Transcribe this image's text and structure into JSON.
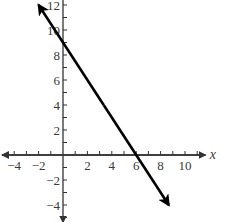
{
  "chart_data": {
    "type": "line",
    "title": "",
    "xlabel": "x",
    "ylabel": "",
    "xlim": [
      -4.8,
      11.2
    ],
    "ylim": [
      -5,
      12.5
    ],
    "x_ticks": [
      -4,
      -2,
      2,
      4,
      6,
      8,
      10
    ],
    "y_ticks": [
      -4,
      -2,
      2,
      4,
      6,
      8,
      10,
      12
    ],
    "x_minor_step": 1,
    "y_minor_step": 1,
    "grid": false,
    "series": [
      {
        "name": "line",
        "equation": "y = -1.5x + 9",
        "slope": -1.5,
        "y_intercept": 9,
        "x_intercept": 6,
        "points": [
          {
            "x": -2,
            "y": 12
          },
          {
            "x": 0,
            "y": 9
          },
          {
            "x": 6,
            "y": 0
          },
          {
            "x": 8.67,
            "y": -4
          }
        ],
        "arrows_both_ends": true,
        "color": "#000000"
      }
    ]
  },
  "colors": {
    "axis": "#333333",
    "line": "#000000",
    "text": "#3a3a3a",
    "background": "#ffffff"
  }
}
